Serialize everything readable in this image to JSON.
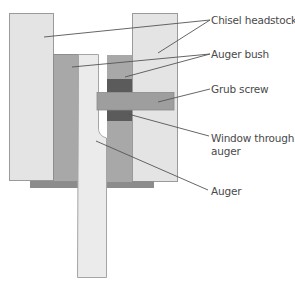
{
  "diagram": {
    "type": "cross-section",
    "colors": {
      "headstock": "#e4e4e4",
      "headstock_stroke": "#9a9a9a",
      "bush": "#a8a8a8",
      "bush_dark": "#5b5b5b",
      "grub_screw": "#9e9e9e",
      "base_plate": "#8c8c8c",
      "auger": "#ebebeb",
      "leader_line": "#555555",
      "text": "#4a4a4a"
    },
    "labels": [
      {
        "id": "chisel-headstock",
        "text": "Chisel headstock"
      },
      {
        "id": "auger-bush",
        "text": "Auger bush"
      },
      {
        "id": "grub-screw",
        "text": "Grub screw"
      },
      {
        "id": "window-through-auger",
        "line1": "Window through",
        "line2": "auger"
      },
      {
        "id": "auger",
        "text": "Auger"
      }
    ]
  }
}
